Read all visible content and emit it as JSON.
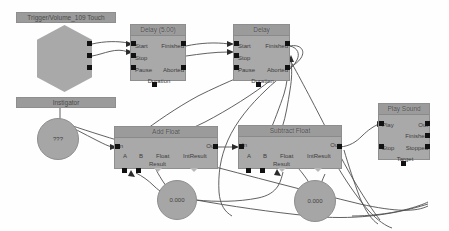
{
  "editor": {
    "name": "visual-script-graph",
    "background_color": "#fefefe",
    "node_fill": "#a9a9a9",
    "node_header_fill": "#9b9b9b",
    "port_color": "#111111",
    "wire_color": "#4a4a4a"
  },
  "nodes": {
    "trigger_title": "Trigger/Volume_109 Touch",
    "trigger_ports": {
      "touched": "Touched",
      "untouched": "UnTouched",
      "empty": "Empty"
    },
    "instigator_bar": "Instigator",
    "instigator_value": "???",
    "delay1": {
      "title": "Delay (5.00)",
      "start": "Start",
      "stop": "Stop",
      "pause": "Pause",
      "finished": "Finished",
      "aborted": "Aborted",
      "duration": "Duration"
    },
    "delay2": {
      "title": "Delay",
      "start": "Start",
      "stop": "Stop",
      "pause": "Pause",
      "finished": "Finished",
      "aborted": "Aborted",
      "duration": "Duration"
    },
    "add_float": {
      "title": "Add Float",
      "in": "In",
      "out": "Out",
      "a": "A",
      "b": "B",
      "float": "Float",
      "result": "Result",
      "int_result": "IntResult"
    },
    "subtract_float": {
      "title": "Subtract Float",
      "in": "In",
      "out": "Out",
      "a": "A",
      "b": "B",
      "float": "Float",
      "result": "Result",
      "int_result": "IntResult"
    },
    "play_sound": {
      "title": "Play Sound",
      "play": "Play",
      "stop": "Stop",
      "out": "Out",
      "finished": "Finished",
      "stopped": "Stopped",
      "target": "Target"
    },
    "const_a": "0.000",
    "const_b": "0.000"
  }
}
